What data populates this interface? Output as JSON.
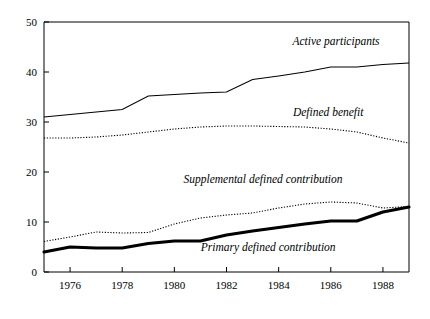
{
  "chart_data": {
    "type": "line",
    "title": "",
    "subtitle": "",
    "xlabel": "",
    "ylabel": "",
    "xlim": [
      1975,
      1989
    ],
    "ylim": [
      0,
      50
    ],
    "grid": false,
    "legend_position": "inline-annotations",
    "x": [
      1975,
      1976,
      1977,
      1978,
      1979,
      1980,
      1981,
      1982,
      1983,
      1984,
      1985,
      1986,
      1987,
      1988,
      1989
    ],
    "xticks": [
      1976,
      1978,
      1980,
      1982,
      1984,
      1986,
      1988
    ],
    "xticklabels": [
      "1976",
      "1978",
      "1980",
      "1982",
      "1984",
      "1986",
      "1988"
    ],
    "yticks": [
      0,
      10,
      20,
      30,
      40,
      50
    ],
    "yticklabels": [
      "0",
      "10",
      "20",
      "30",
      "40",
      "50"
    ],
    "series": [
      {
        "name": "Active participants",
        "style": "solid",
        "label_x": 1986.2,
        "label_y": 45.4,
        "values": [
          31.0,
          31.5,
          32.0,
          32.5,
          35.2,
          35.5,
          35.8,
          36.0,
          38.5,
          39.2,
          40.0,
          41.0,
          41.0,
          41.5,
          41.8
        ]
      },
      {
        "name": "Defined benefit",
        "style": "dotted",
        "label_x": 1985.9,
        "label_y": 31.2,
        "values": [
          26.8,
          26.8,
          27.0,
          27.4,
          28.0,
          28.6,
          29.0,
          29.2,
          29.2,
          29.1,
          29.0,
          28.6,
          28.0,
          26.8,
          25.8
        ]
      },
      {
        "name": "Supplemental defined contribution",
        "style": "dotted",
        "label_x": 1983.4,
        "label_y": 17.8,
        "values": [
          6.1,
          7.0,
          8.0,
          7.8,
          7.9,
          9.6,
          10.8,
          11.4,
          11.8,
          12.8,
          13.6,
          14.0,
          13.8,
          12.8,
          13.1
        ]
      },
      {
        "name": "Primary defined contribution",
        "style": "bold",
        "label_x": 1983.6,
        "label_y": 4.2,
        "values": [
          4.0,
          5.0,
          4.8,
          4.8,
          5.7,
          6.2,
          6.2,
          7.4,
          8.2,
          8.9,
          9.6,
          10.2,
          10.2,
          12.0,
          13.0
        ]
      }
    ]
  }
}
